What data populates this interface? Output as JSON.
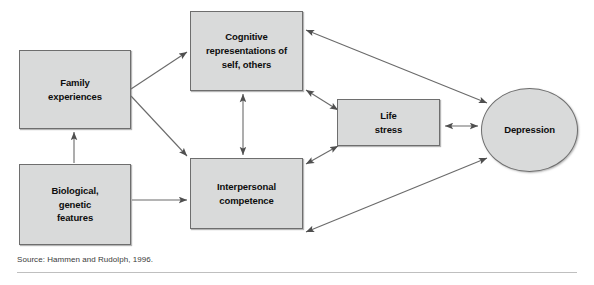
{
  "figure": {
    "title": "",
    "source_note": "Source: Hammen and Rudolph, 1996.",
    "colors": {
      "node_fill": "#d9dada",
      "node_stroke": "#6e6e6e",
      "arrow": "#5a5a5a",
      "text": "#0d0d0d",
      "rule": "#bfbfbf"
    }
  },
  "nodes": [
    {
      "id": "family",
      "label": "Family\nexperiences",
      "shape": "rect"
    },
    {
      "id": "biological",
      "label": "Biological,\ngenetic\nfeatures",
      "shape": "rect"
    },
    {
      "id": "cognitive",
      "label": "Cognitive\nrepresentations of\nself, others",
      "shape": "rect"
    },
    {
      "id": "interpersonal",
      "label": "Interpersonal\ncompetence",
      "shape": "rect"
    },
    {
      "id": "lifestress",
      "label": "Life\nstress",
      "shape": "rect"
    },
    {
      "id": "depression",
      "label": "Depression",
      "shape": "ellipse"
    }
  ],
  "edges": [
    {
      "id": "biological-to-family",
      "from": "biological",
      "to": "family",
      "direction": "single"
    },
    {
      "id": "family-to-cognitive",
      "from": "family",
      "to": "cognitive",
      "direction": "single"
    },
    {
      "id": "family-to-interpersonal",
      "from": "family",
      "to": "interpersonal",
      "direction": "single"
    },
    {
      "id": "biological-to-interpersonal",
      "from": "biological",
      "to": "interpersonal",
      "direction": "single"
    },
    {
      "id": "cognitive-interpersonal",
      "from": "cognitive",
      "to": "interpersonal",
      "direction": "double"
    },
    {
      "id": "cognitive-lifestress",
      "from": "cognitive",
      "to": "lifestress",
      "direction": "double"
    },
    {
      "id": "interpersonal-lifestress",
      "from": "interpersonal",
      "to": "lifestress",
      "direction": "double"
    },
    {
      "id": "cognitive-depression",
      "from": "cognitive",
      "to": "depression",
      "direction": "double"
    },
    {
      "id": "interpersonal-depression",
      "from": "interpersonal",
      "to": "depression",
      "direction": "double"
    },
    {
      "id": "lifestress-depression",
      "from": "lifestress",
      "to": "depression",
      "direction": "double"
    }
  ]
}
